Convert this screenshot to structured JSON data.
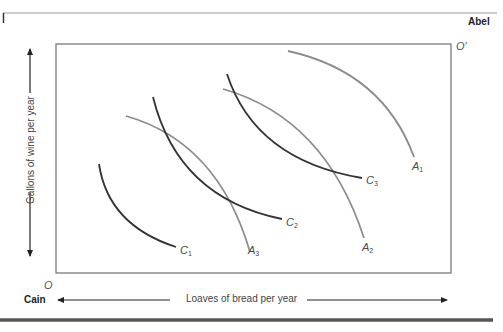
{
  "diagram": {
    "title_parties": {
      "top_right": "Abel",
      "bottom_left": "Cain"
    },
    "origins": {
      "cain_origin": "O",
      "abel_origin": "O′"
    },
    "axes": {
      "x_label": "Loaves of bread per year",
      "y_label": "Gallons of wine per year"
    },
    "curves": {
      "cain_indifference": [
        {
          "id": "C1",
          "letter": "C",
          "sub": "1",
          "color": "#333333"
        },
        {
          "id": "C2",
          "letter": "C",
          "sub": "2",
          "color": "#333333"
        },
        {
          "id": "C3",
          "letter": "C",
          "sub": "3",
          "color": "#333333"
        }
      ],
      "abel_indifference": [
        {
          "id": "A1",
          "letter": "A",
          "sub": "1",
          "color": "#8c8c8c"
        },
        {
          "id": "A2",
          "letter": "A",
          "sub": "2",
          "color": "#8c8c8c"
        },
        {
          "id": "A3",
          "letter": "A",
          "sub": "3",
          "color": "#8c8c8c"
        }
      ]
    },
    "colors": {
      "box": "#7a7a7a",
      "cain_curves": "#333333",
      "abel_curves": "#8c8c8c",
      "rule_bottom": "#555555",
      "rule_top": "#9a9a9a"
    }
  }
}
